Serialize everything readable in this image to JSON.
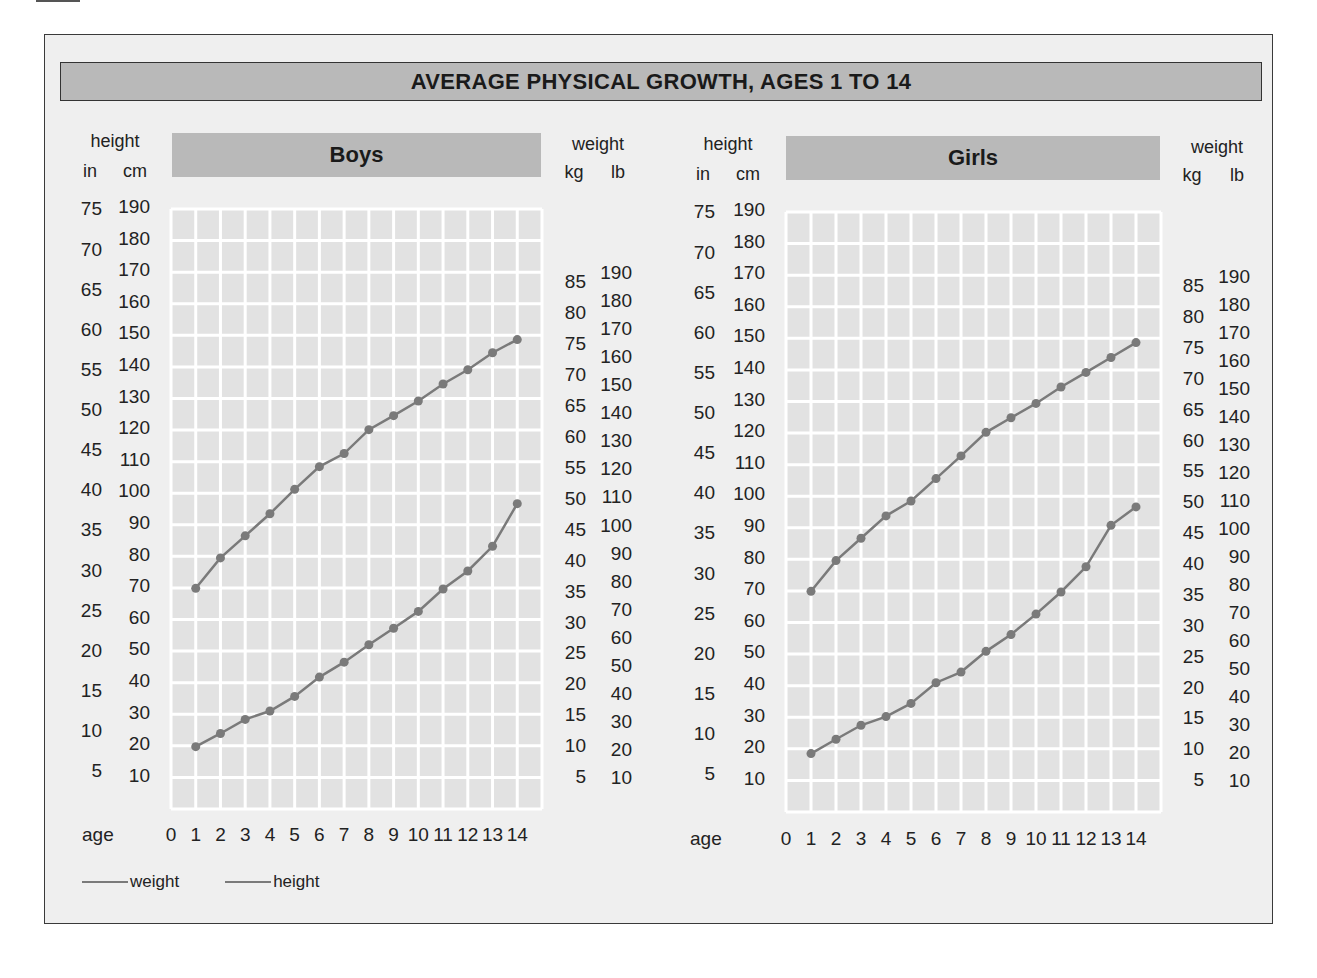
{
  "title": "AVERAGE PHYSICAL GROWTH, AGES 1 TO 14",
  "colors": {
    "frame_bg": "#efefef",
    "header_fill": "#b9b9b9",
    "grid_cell": "#e2e2e2",
    "grid_line": "#ffffff",
    "series_line": "#7a7a7a",
    "marker": "#7a7a7a"
  },
  "axis_titles": {
    "height": "height",
    "in": "in",
    "cm": "cm",
    "weight": "weight",
    "kg": "kg",
    "lb": "lb",
    "age": "age"
  },
  "ticks": {
    "in": [
      "75",
      "70",
      "65",
      "60",
      "55",
      "50",
      "45",
      "40",
      "35",
      "30",
      "25",
      "20",
      "15",
      "10",
      "5"
    ],
    "cm": [
      "190",
      "180",
      "170",
      "160",
      "150",
      "140",
      "130",
      "120",
      "110",
      "100",
      "90",
      "80",
      "70",
      "60",
      "50",
      "40",
      "30",
      "20",
      "10"
    ],
    "kg": [
      "85",
      "80",
      "75",
      "70",
      "65",
      "60",
      "55",
      "50",
      "45",
      "40",
      "35",
      "30",
      "25",
      "20",
      "15",
      "10",
      "5"
    ],
    "lb": [
      "190",
      "180",
      "170",
      "160",
      "150",
      "140",
      "130",
      "120",
      "110",
      "100",
      "90",
      "80",
      "70",
      "60",
      "50",
      "40",
      "30",
      "20",
      "10"
    ],
    "age": [
      "0",
      "1",
      "2",
      "3",
      "4",
      "5",
      "6",
      "7",
      "8",
      "9",
      "10",
      "11",
      "12",
      "13",
      "14"
    ]
  },
  "legend": {
    "weight": "weight",
    "height": "height"
  },
  "panels": [
    {
      "label": "Boys"
    },
    {
      "label": "Girls"
    }
  ],
  "chart_data": [
    {
      "type": "line",
      "title": "Boys",
      "suptitle": "AVERAGE PHYSICAL GROWTH, AGES 1 TO 14",
      "xlabel": "age",
      "ylabel_left": "height (in / cm)",
      "ylabel_right": "weight (kg / lb)",
      "x": [
        1,
        2,
        3,
        4,
        5,
        6,
        7,
        8,
        9,
        10,
        11,
        12,
        13,
        14
      ],
      "xlim": [
        0,
        15
      ],
      "ylim_cm": [
        0,
        190
      ],
      "ylim_lb": [
        0,
        190
      ],
      "grid": true,
      "legend_position": "bottom-left",
      "series": [
        {
          "name": "height",
          "unit": "cm",
          "values": [
            73.4,
            83.6,
            91.0,
            98.4,
            106.6,
            114.2,
            118.6,
            126.6,
            131.3,
            136.2,
            141.9,
            146.7,
            152.4,
            156.8
          ]
        },
        {
          "name": "weight",
          "unit": "lb",
          "values": [
            21.2,
            25.9,
            30.9,
            33.9,
            39.1,
            46.0,
            51.3,
            57.5,
            63.4,
            69.4,
            77.4,
            83.8,
            92.6,
            107.8
          ]
        },
        {
          "name": "weight_kg",
          "unit": "kg",
          "values": [
            9.6,
            11.8,
            14.0,
            15.4,
            17.7,
            20.9,
            23.3,
            26.1,
            28.8,
            31.5,
            35.1,
            38.0,
            42.0,
            48.9
          ]
        }
      ]
    },
    {
      "type": "line",
      "title": "Girls",
      "suptitle": "AVERAGE PHYSICAL GROWTH, AGES 1 TO 14",
      "xlabel": "age",
      "ylabel_left": "height (in / cm)",
      "ylabel_right": "weight (kg / lb)",
      "x": [
        1,
        2,
        3,
        4,
        5,
        6,
        7,
        8,
        9,
        10,
        11,
        12,
        13,
        14
      ],
      "xlim": [
        0,
        15
      ],
      "ylim_cm": [
        0,
        190
      ],
      "ylim_lb": [
        0,
        190
      ],
      "grid": true,
      "series": [
        {
          "name": "height",
          "unit": "cm",
          "values": [
            73.4,
            83.7,
            91.2,
            98.7,
            103.7,
            111.2,
            118.8,
            126.7,
            131.6,
            136.4,
            141.9,
            146.8,
            151.8,
            156.8
          ]
        },
        {
          "name": "weight",
          "unit": "lb",
          "values": [
            19.8,
            24.9,
            29.9,
            33.0,
            37.7,
            45.1,
            48.9,
            56.3,
            62.3,
            69.6,
            77.5,
            86.5,
            101.3,
            107.9
          ]
        },
        {
          "name": "weight_kg",
          "unit": "kg",
          "values": [
            9.0,
            11.3,
            13.6,
            15.0,
            17.1,
            20.5,
            22.2,
            25.5,
            28.3,
            31.6,
            35.2,
            39.2,
            46.0,
            48.9
          ]
        }
      ]
    }
  ]
}
